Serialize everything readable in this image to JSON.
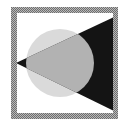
{
  "icon": {
    "semantic": "spotlight-icon",
    "colors": {
      "background": "#ffffff",
      "frame": "#8c8c8c",
      "frame_inner": "#ffffff",
      "circle": "#dadada",
      "beam_inside_circle": "#b2b2b2",
      "beam_outside_circle": "#141414"
    }
  }
}
